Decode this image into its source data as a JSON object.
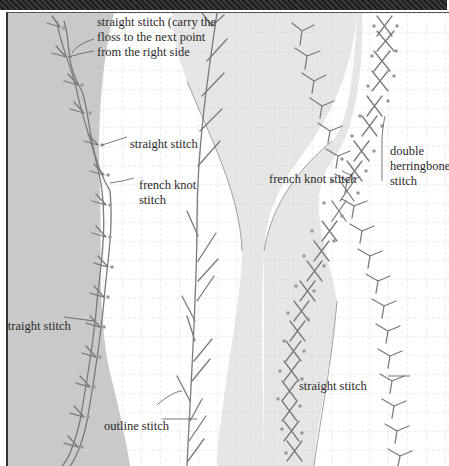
{
  "diagram": {
    "colors": {
      "band_dark_gray": "#c9c9c9",
      "band_light_gray": "#e6e6e6",
      "background": "#ffffff",
      "grid": "#d4d4d4",
      "stitch": "#7a7a7a",
      "knot_dot": "#9a9a9a",
      "text": "#2b2b2b"
    },
    "labels": [
      {
        "id": "straight-stitch-carry",
        "text": "straight stitch (carry the\nfloss to the next point\nfrom the right side"
      },
      {
        "id": "straight-stitch-1",
        "text": "straight stitch"
      },
      {
        "id": "french-knot-stitch-1",
        "text": "french knot\nstitch"
      },
      {
        "id": "french-knot-stitch-2",
        "text": "french knot stitch"
      },
      {
        "id": "double-herringbone-stitch",
        "text": "double\nherringbone\nstitch"
      },
      {
        "id": "straight-stitch-2",
        "text": "straight stitch"
      },
      {
        "id": "straight-stitch-3",
        "text": "straight stitch"
      },
      {
        "id": "outline-stitch",
        "text": "outline stitch"
      }
    ]
  }
}
